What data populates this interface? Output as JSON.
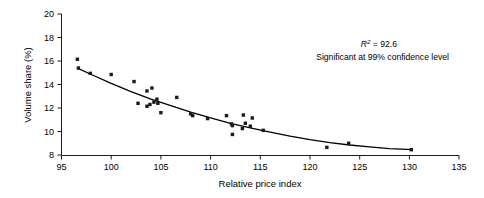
{
  "chart_data": {
    "type": "scatter",
    "title": "",
    "xlabel": "Relative price index",
    "ylabel": "Volume share (%)",
    "xlim": [
      95,
      135
    ],
    "ylim": [
      8,
      20
    ],
    "xticks": [
      95,
      100,
      105,
      110,
      115,
      120,
      125,
      130,
      135
    ],
    "yticks": [
      8,
      10,
      12,
      14,
      16,
      18,
      20
    ],
    "grid": false,
    "legend": null,
    "marker_style": "filled-square",
    "marker_color": "#1a1a1a",
    "series": [
      {
        "name": "Observations",
        "points": [
          [
            96.6,
            16.15
          ],
          [
            96.7,
            15.4
          ],
          [
            97.9,
            14.95
          ],
          [
            100.0,
            14.85
          ],
          [
            102.3,
            14.25
          ],
          [
            102.7,
            12.4
          ],
          [
            103.6,
            13.45
          ],
          [
            103.6,
            12.15
          ],
          [
            103.9,
            12.3
          ],
          [
            104.1,
            13.7
          ],
          [
            104.3,
            12.5
          ],
          [
            104.6,
            12.75
          ],
          [
            104.7,
            12.4
          ],
          [
            105.0,
            11.6
          ],
          [
            106.6,
            12.9
          ],
          [
            108.0,
            11.5
          ],
          [
            108.2,
            11.35
          ],
          [
            109.7,
            11.1
          ],
          [
            111.6,
            11.35
          ],
          [
            112.1,
            10.65
          ],
          [
            112.2,
            10.5
          ],
          [
            112.2,
            9.75
          ],
          [
            113.2,
            10.25
          ],
          [
            113.3,
            11.4
          ],
          [
            113.5,
            10.7
          ],
          [
            114.0,
            10.45
          ],
          [
            114.2,
            11.15
          ],
          [
            115.3,
            10.1
          ],
          [
            121.7,
            8.65
          ],
          [
            123.9,
            9.0
          ],
          [
            130.2,
            8.45
          ]
        ]
      }
    ],
    "fit_curve": {
      "name": "Fitted trend",
      "type": "exponential-decay",
      "points": [
        [
          96.6,
          15.4
        ],
        [
          98.0,
          14.85
        ],
        [
          100.0,
          14.1
        ],
        [
          102.0,
          13.4
        ],
        [
          104.0,
          12.75
        ],
        [
          106.0,
          12.2
        ],
        [
          108.0,
          11.65
        ],
        [
          110.0,
          11.15
        ],
        [
          112.0,
          10.7
        ],
        [
          114.0,
          10.3
        ],
        [
          116.0,
          9.95
        ],
        [
          118.0,
          9.6
        ],
        [
          120.0,
          9.3
        ],
        [
          122.0,
          9.05
        ],
        [
          124.0,
          8.85
        ],
        [
          126.0,
          8.7
        ],
        [
          128.0,
          8.55
        ],
        [
          130.3,
          8.45
        ]
      ]
    },
    "annotations": [
      {
        "name": "r-squared",
        "text_prefix": "R",
        "text_superscript": "2",
        "text_suffix": " = 92.6",
        "full_text": "R2 = 92.6"
      },
      {
        "name": "significance",
        "full_text": "Significant at 99% confidence level"
      }
    ]
  }
}
